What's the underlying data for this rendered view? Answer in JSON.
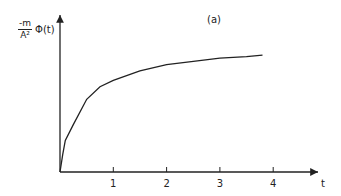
{
  "chart_data": {
    "type": "line",
    "title": "",
    "panel_label": "(a)",
    "xlabel": "t",
    "ylabel": "-m/A² Φ(t)",
    "ylabel_parts": {
      "numerator": "-m",
      "denominator": "A²",
      "function": "Φ(t)"
    },
    "xticks": [
      "1",
      "2",
      "3",
      "4"
    ],
    "xlim": [
      0,
      4.9
    ],
    "ylim": [
      0,
      1
    ],
    "grid": false,
    "legend": null,
    "series": [
      {
        "name": "Φ(t)",
        "x": [
          0,
          0.05,
          0.1,
          0.25,
          0.5,
          0.75,
          1.0,
          1.5,
          2.0,
          2.5,
          3.0,
          3.5,
          3.8
        ],
        "y": [
          0,
          0.11,
          0.2,
          0.3,
          0.46,
          0.54,
          0.58,
          0.64,
          0.68,
          0.7,
          0.72,
          0.73,
          0.74
        ]
      }
    ]
  }
}
